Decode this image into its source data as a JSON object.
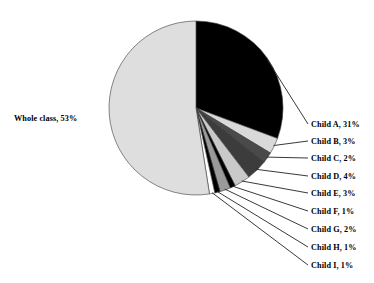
{
  "chart_data": {
    "type": "pie",
    "title": "",
    "start_angle_deg": 0,
    "direction": "clockwise",
    "legend": "leader-labels",
    "grid": false,
    "categories": [
      "Child A",
      "Child B",
      "Child C",
      "Child D",
      "Child E",
      "Child F",
      "Child G",
      "Child H",
      "Child I",
      "Whole class"
    ],
    "values": [
      31,
      3,
      2,
      4,
      3,
      1,
      2,
      1,
      1,
      53
    ],
    "unit": "%",
    "labels": [
      "Child A, 31%",
      "Child B, 3%",
      "Child C, 2%",
      "Child D, 4%",
      "Child E, 3%",
      "Child F, 1%",
      "Child G, 2%",
      "Child H, 1%",
      "Child I, 1%",
      "Whole class, 53%"
    ],
    "colors": [
      "#000000",
      "#d9d9d9",
      "#4a4a4a",
      "#3c3c3c",
      "#c9c9c9",
      "#000000",
      "#9a9a9a",
      "#000000",
      "#ffffff",
      "#dedede"
    ]
  },
  "slices": [
    {
      "name": "Child A",
      "value": 31,
      "label": "Child A, 31%",
      "color": "#000000"
    },
    {
      "name": "Child B",
      "value": 3,
      "label": "Child B, 3%",
      "color": "#d9d9d9"
    },
    {
      "name": "Child C",
      "value": 2,
      "label": "Child C, 2%",
      "color": "#4a4a4a"
    },
    {
      "name": "Child D",
      "value": 4,
      "label": "Child D, 4%",
      "color": "#3c3c3c"
    },
    {
      "name": "Child E",
      "value": 3,
      "label": "Child E, 3%",
      "color": "#c9c9c9"
    },
    {
      "name": "Child F",
      "value": 1,
      "label": "Child F, 1%",
      "color": "#000000"
    },
    {
      "name": "Child G",
      "value": 2,
      "label": "Child G, 2%",
      "color": "#9a9a9a"
    },
    {
      "name": "Child H",
      "value": 1,
      "label": "Child H, 1%",
      "color": "#000000"
    },
    {
      "name": "Child I",
      "value": 1,
      "label": "Child I, 1%",
      "color": "#ffffff"
    },
    {
      "name": "Whole class",
      "value": 53,
      "label": "Whole class, 53%",
      "color": "#dedede"
    }
  ],
  "labels": {
    "whole_class": "Whole class, 53%",
    "child_a": "Child A, 31%",
    "child_b": "Child B, 3%",
    "child_c": "Child C, 2%",
    "child_d": "Child D, 4%",
    "child_e": "Child E, 3%",
    "child_f": "Child F, 1%",
    "child_g": "Child G, 2%",
    "child_h": "Child H, 1%",
    "child_i": "Child I, 1%"
  }
}
